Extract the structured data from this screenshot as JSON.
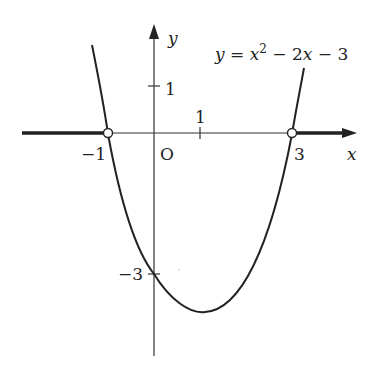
{
  "figure": {
    "equation": "y = x² − 2x − 3",
    "equation_parts": {
      "lhs": "y",
      "eq": " = ",
      "x": "x",
      "sup": "2",
      "rest": " − 2",
      "x2": "x",
      "tail": " − 3"
    },
    "axis_x_label": "x",
    "axis_y_label": "y",
    "origin_label": "O",
    "ticks": {
      "x_one": "1",
      "y_one": "1",
      "x_neg_one": "−1",
      "x_three": "3",
      "y_neg_three": "−3"
    },
    "roots": [
      -1,
      3
    ],
    "y_intercept": -3,
    "vertex": [
      1,
      -4
    ],
    "highlighted_intervals": [
      "x < -1",
      "x > 3"
    ],
    "colors": {
      "ink": "#222222",
      "circle_fill": "#ffffff"
    }
  }
}
